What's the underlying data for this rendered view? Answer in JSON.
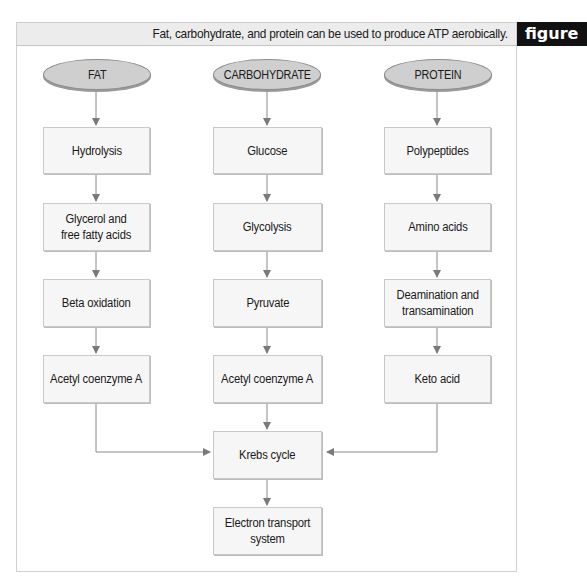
{
  "header": {
    "title": "Fat, carbohydrate, and protein can be used to produce ATP aerobically.",
    "figure_label": "figure"
  },
  "sources": {
    "fat": "FAT",
    "carbohydrate": "CARBOHYDRATE",
    "protein": "PROTEIN"
  },
  "fat_path": [
    "Hydrolysis",
    "Glycerol and\nfree fatty acids",
    "Beta oxidation",
    "Acetyl coenzyme A"
  ],
  "carbohydrate_path": [
    "Glucose",
    "Glycolysis",
    "Pyruvate",
    "Acetyl coenzyme A"
  ],
  "protein_path": [
    "Polypeptides",
    "Amino acids",
    "Deamination and\ntransamination",
    "Keto acid"
  ],
  "common_path": [
    "Krebs cycle",
    "Electron transport\nsystem"
  ],
  "colors": {
    "oval_fill": "#cfcfcf",
    "box_fill": "#f6f6f6",
    "header_fill": "#ececec",
    "figure_tag": "#111111",
    "arrow": "#7a7a7a"
  }
}
